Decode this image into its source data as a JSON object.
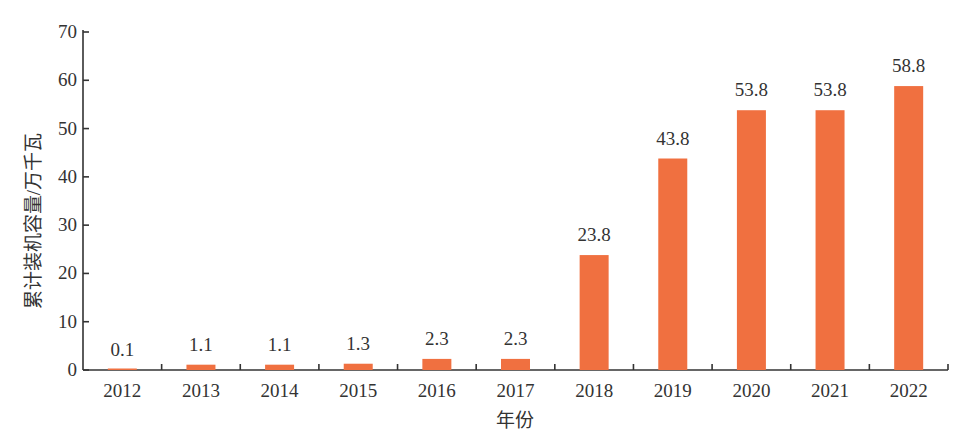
{
  "chart_data": {
    "type": "bar",
    "title": "",
    "xlabel": "年份",
    "ylabel": "累计装机容量/万千瓦",
    "categories": [
      "2012",
      "2013",
      "2014",
      "2015",
      "2016",
      "2017",
      "2018",
      "2019",
      "2020",
      "2021",
      "2022"
    ],
    "values": [
      0.1,
      1.1,
      1.1,
      1.3,
      2.3,
      2.3,
      23.8,
      43.8,
      53.8,
      53.8,
      58.8
    ],
    "data_labels": [
      "0.1",
      "1.1",
      "1.1",
      "1.3",
      "2.3",
      "2.3",
      "23.8",
      "43.8",
      "53.8",
      "53.8",
      "58.8"
    ],
    "ylim": [
      0,
      70
    ],
    "yticks": [
      0,
      10,
      20,
      30,
      40,
      50,
      60,
      70
    ],
    "ytick_labels": [
      "0",
      "10",
      "20",
      "30",
      "40",
      "50",
      "60",
      "70"
    ],
    "grid": false,
    "legend": "none",
    "bar_color": "#f07040"
  }
}
